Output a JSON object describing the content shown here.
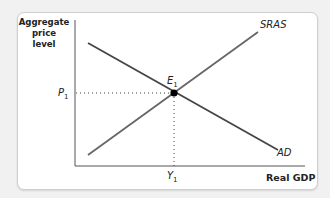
{
  "diagram": {
    "y_axis_label": "Aggregate price level",
    "y_axis_lines": [
      "Aggregate",
      "price",
      "level"
    ],
    "x_axis_label": "Real GDP",
    "curves": [
      {
        "name": "SRAS",
        "label": "SRAS",
        "slope": "upward"
      },
      {
        "name": "AD",
        "label": "AD",
        "slope": "downward"
      }
    ],
    "equilibrium": {
      "label": "E",
      "sub": "1"
    },
    "price_marker": {
      "label": "P",
      "sub": "1"
    },
    "output_marker": {
      "label": "Y",
      "sub": "1"
    }
  }
}
